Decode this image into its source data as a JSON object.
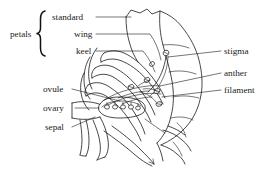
{
  "diagram": {
    "background_color": "#ffffff",
    "ink_color": "#1a1a1a",
    "group_labels": [
      {
        "id": "petals",
        "text": "petals",
        "x": 10,
        "y": 40
      }
    ],
    "labels": [
      {
        "id": "standard",
        "text": "standard",
        "x": 52,
        "y": 20,
        "side": "left",
        "anchor": "start"
      },
      {
        "id": "wing",
        "text": "wing",
        "x": 74,
        "y": 37,
        "side": "left",
        "anchor": "start"
      },
      {
        "id": "keel",
        "text": "keel",
        "x": 76,
        "y": 54,
        "side": "left",
        "anchor": "start"
      },
      {
        "id": "ovule",
        "text": "ovule",
        "x": 43,
        "y": 91,
        "side": "left",
        "anchor": "start"
      },
      {
        "id": "ovary",
        "text": "ovary",
        "x": 43,
        "y": 110,
        "side": "left",
        "anchor": "start"
      },
      {
        "id": "sepal",
        "text": "sepal",
        "x": 45,
        "y": 129,
        "side": "left",
        "anchor": "start"
      },
      {
        "id": "stigma",
        "text": "stigma",
        "x": 224,
        "y": 54,
        "side": "right",
        "anchor": "start"
      },
      {
        "id": "anther",
        "text": "anther",
        "x": 224,
        "y": 76,
        "side": "right",
        "anchor": "start"
      },
      {
        "id": "filament",
        "text": "filament",
        "x": 224,
        "y": 93,
        "side": "right",
        "anchor": "start"
      }
    ],
    "parts": [
      {
        "id": "standard",
        "name": "standard petal",
        "count": 1
      },
      {
        "id": "wing",
        "name": "wing petal",
        "count": 2
      },
      {
        "id": "keel",
        "name": "keel petal",
        "count": 2
      },
      {
        "id": "stigma",
        "name": "stigma",
        "count": 1
      },
      {
        "id": "anther",
        "name": "anther",
        "count": 4
      },
      {
        "id": "filament",
        "name": "filament",
        "count": 4
      },
      {
        "id": "ovary",
        "name": "ovary",
        "count": 1
      },
      {
        "id": "ovule",
        "name": "ovule",
        "count": 5
      },
      {
        "id": "sepal",
        "name": "sepal",
        "count": 1
      }
    ]
  }
}
